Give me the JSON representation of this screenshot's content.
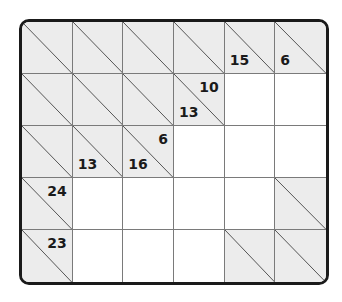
{
  "puzzle": {
    "type": "kakuro",
    "rows": 5,
    "cols": 6,
    "colors": {
      "block": "#ececec",
      "white": "#ffffff",
      "border": "#1a1a1a",
      "gridline": "#7a7a7a"
    },
    "cells": [
      [
        {
          "t": "b"
        },
        {
          "t": "b"
        },
        {
          "t": "b"
        },
        {
          "t": "b"
        },
        {
          "t": "b",
          "down": "15"
        },
        {
          "t": "b",
          "down": "6"
        }
      ],
      [
        {
          "t": "b"
        },
        {
          "t": "b"
        },
        {
          "t": "b"
        },
        {
          "t": "b",
          "right": "10",
          "down": "13"
        },
        {
          "t": "w"
        },
        {
          "t": "w"
        }
      ],
      [
        {
          "t": "b"
        },
        {
          "t": "b",
          "down": "13"
        },
        {
          "t": "b",
          "right": "6",
          "down": "16"
        },
        {
          "t": "w"
        },
        {
          "t": "w"
        },
        {
          "t": "w"
        }
      ],
      [
        {
          "t": "b",
          "right": "24"
        },
        {
          "t": "w"
        },
        {
          "t": "w"
        },
        {
          "t": "w"
        },
        {
          "t": "w"
        },
        {
          "t": "b"
        }
      ],
      [
        {
          "t": "b",
          "right": "23"
        },
        {
          "t": "w"
        },
        {
          "t": "w"
        },
        {
          "t": "w"
        },
        {
          "t": "b"
        },
        {
          "t": "b"
        }
      ]
    ]
  }
}
